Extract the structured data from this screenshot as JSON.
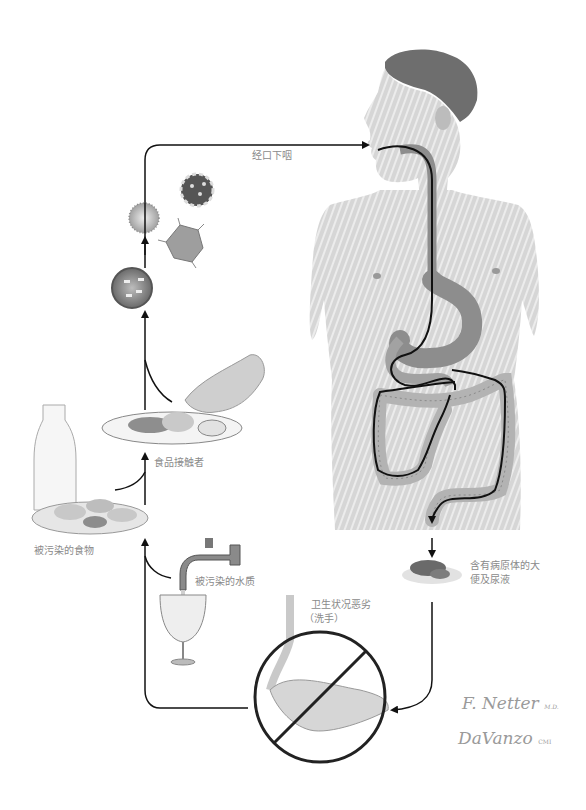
{
  "diagram": {
    "type": "fecal-oral transmission cycle",
    "colors": {
      "line": "#111111",
      "label": "#8a8a8a",
      "skin": "#d9d9d9",
      "organ": "#a9a9a9",
      "background": "#ffffff"
    },
    "labels": {
      "oral_ingestion": "经口下咽",
      "food_handler": "食品接触者",
      "contaminated_food": "被污染的食物",
      "contaminated_water": "被污染的水质",
      "feces_line1": "含有病原体的大",
      "feces_line2": "便及尿液",
      "hygiene_line1": "卫生状况恶劣",
      "hygiene_line2": "（洗手）"
    },
    "nodes": [
      {
        "id": "pathogens",
        "icon": "virus-icons",
        "count": 4
      },
      {
        "id": "human-body",
        "icon": "digestive-tract-illustration"
      },
      {
        "id": "feces",
        "icon": "feces-illustration"
      },
      {
        "id": "handwashing",
        "icon": "prohibited-handwashing-icon"
      },
      {
        "id": "water",
        "icon": "faucet-and-glass-illustration"
      },
      {
        "id": "food",
        "icon": "milk-bottle-and-oysters-illustration"
      },
      {
        "id": "food-handler",
        "icon": "hand-over-plate-illustration"
      }
    ],
    "signatures": {
      "artist1": "F. Netter",
      "artist1_suffix": "M.D.",
      "artist2": "DaVanzo",
      "artist2_suffix": "CMI"
    }
  }
}
